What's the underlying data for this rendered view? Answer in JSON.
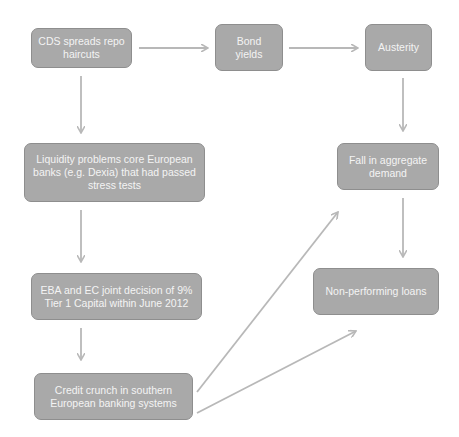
{
  "diagram": {
    "type": "flowchart",
    "colors": {
      "node_fill": "#a9a9a9",
      "node_border": "#8e8e8e",
      "node_text": "#f4f4f4",
      "arrow": "#b8b8b8",
      "background": "#ffffff"
    },
    "nodes": [
      {
        "id": "cds",
        "label": "CDS spreads repo haircuts"
      },
      {
        "id": "bond",
        "label": "Bond yields"
      },
      {
        "id": "austerity",
        "label": "Austerity"
      },
      {
        "id": "liquidity",
        "label": "Liquidity problems core European banks (e.g. Dexia) that had passed stress tests"
      },
      {
        "id": "fall",
        "label": "Fall in aggregate demand"
      },
      {
        "id": "eba",
        "label": "EBA and EC joint decision of 9% Tier 1 Capital within June 2012"
      },
      {
        "id": "npl",
        "label": "Non-performing loans"
      },
      {
        "id": "credit",
        "label": "Credit crunch in southern European banking systems"
      }
    ],
    "edges": [
      {
        "from": "cds",
        "to": "bond"
      },
      {
        "from": "bond",
        "to": "austerity"
      },
      {
        "from": "cds",
        "to": "liquidity"
      },
      {
        "from": "austerity",
        "to": "fall"
      },
      {
        "from": "liquidity",
        "to": "eba"
      },
      {
        "from": "fall",
        "to": "npl"
      },
      {
        "from": "eba",
        "to": "credit"
      },
      {
        "from": "credit",
        "to": "fall"
      },
      {
        "from": "credit",
        "to": "npl"
      }
    ]
  }
}
